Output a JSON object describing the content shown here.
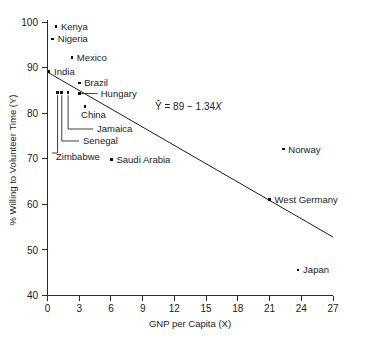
{
  "chart_data": {
    "type": "scatter",
    "title": "",
    "xlabel": "GNP per Capita (X)",
    "ylabel": "% Willing to Volunteer Time (Y)",
    "xlim": [
      0,
      27
    ],
    "ylim": [
      40,
      100
    ],
    "xticks": [
      "0",
      "3",
      "6",
      "9",
      "12",
      "15",
      "18",
      "21",
      "24",
      "27"
    ],
    "yticks": [
      "40",
      "50",
      "60",
      "70",
      "80",
      "90",
      "100"
    ],
    "grid": false,
    "legend": false,
    "points": [
      {
        "label": "Kenya",
        "x": 0.8,
        "y": 99.0,
        "label_side": "right"
      },
      {
        "label": "Nigeria",
        "x": 0.5,
        "y": 96.3,
        "label_side": "right"
      },
      {
        "label": "Mexico",
        "x": 2.3,
        "y": 92.2,
        "label_side": "right"
      },
      {
        "label": "India",
        "x": 0.15,
        "y": 89.2,
        "label_side": "right"
      },
      {
        "label": "Brazil",
        "x": 3.0,
        "y": 86.6,
        "label_side": "right"
      },
      {
        "label": "Hungary",
        "x": 3.05,
        "y": 84.3,
        "label_side": "leader-right"
      },
      {
        "label": "China",
        "x": 3.55,
        "y": 81.5,
        "label_side": "below"
      },
      {
        "label": "Jamaica",
        "x": 1.95,
        "y": 84.6,
        "label_side": "leader-down"
      },
      {
        "label": "Senegal",
        "x": 1.35,
        "y": 84.6,
        "label_side": "leader-down"
      },
      {
        "label": "Zimbabwe",
        "x": 0.95,
        "y": 84.6,
        "label_side": "leader-down"
      },
      {
        "label": "Saudi Arabia",
        "x": 6.05,
        "y": 69.8,
        "label_side": "right"
      },
      {
        "label": "Norway",
        "x": 22.3,
        "y": 72.1,
        "label_side": "right"
      },
      {
        "label": "West Germany",
        "x": 21.0,
        "y": 61.1,
        "label_side": "right"
      },
      {
        "label": "Japan",
        "x": 23.7,
        "y": 45.6,
        "label_side": "right"
      }
    ],
    "regression": {
      "intercept": 89,
      "slope": -1.34,
      "equation_prefix": "Ŷ = 89 − 1.34",
      "equation_variable": "X",
      "x_start": 0,
      "x_end": 27
    },
    "colors": {
      "marker": "#111111",
      "axis": "#2b2b2b",
      "line": "#1a1a1a",
      "background": "#ffffff"
    }
  }
}
